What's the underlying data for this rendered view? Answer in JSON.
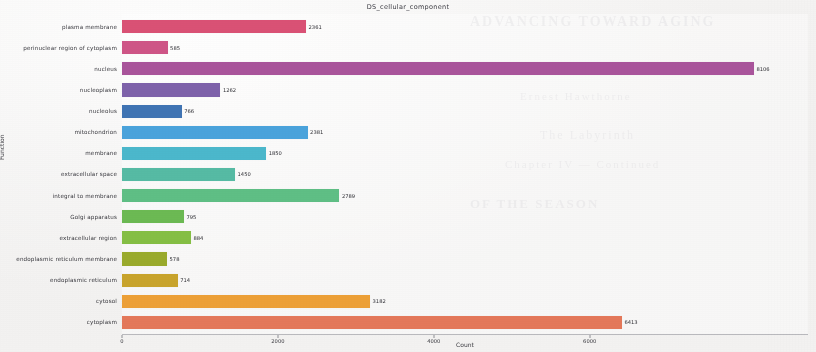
{
  "chart_data": {
    "type": "bar",
    "orientation": "horizontal",
    "title": "DS_cellular_component",
    "xlabel": "Count",
    "ylabel": "Function",
    "xlim": [
      0,
      8800
    ],
    "xticks": [
      0,
      2000,
      4000,
      6000
    ],
    "xtick_labels": [
      "0",
      "2000",
      "4000",
      "6000"
    ],
    "grid": false,
    "legend": "none",
    "categories": [
      "plasma membrane",
      "perinuclear region of cytoplasm",
      "nucleus",
      "nucleoplasm",
      "nucleolus",
      "mitochondrion",
      "membrane",
      "extracellular space",
      "integral to membrane",
      "Golgi apparatus",
      "extracellular region",
      "endoplasmic reticulum membrane",
      "endoplasmic reticulum",
      "cytosol",
      "cytoplasm"
    ],
    "values": [
      2361,
      585,
      8106,
      1262,
      766,
      2381,
      1850,
      1450,
      2789,
      795,
      884,
      578,
      714,
      3182,
      6413
    ],
    "value_labels": [
      "2361",
      "585",
      "8106",
      "1262",
      "766",
      "2381",
      "1850",
      "1450",
      "2789",
      "795",
      "884",
      "578",
      "714",
      "3182",
      "6413"
    ],
    "colors": [
      "#da5175",
      "#cf5587",
      "#a9549b",
      "#7e62aa",
      "#3f74b4",
      "#4aa3dc",
      "#4bb8cc",
      "#56bba4",
      "#5fbf85",
      "#6cba53",
      "#85bf44",
      "#9aab2c",
      "#c9a42c",
      "#eda037",
      "#e4785a"
    ]
  },
  "background_text": {
    "lines": [
      "ADVANCING TOWARD AGING",
      "Ernest Hawthorne",
      "The Labyrinth",
      "Chapter IV — Continued",
      "OF THE SEASON"
    ]
  }
}
